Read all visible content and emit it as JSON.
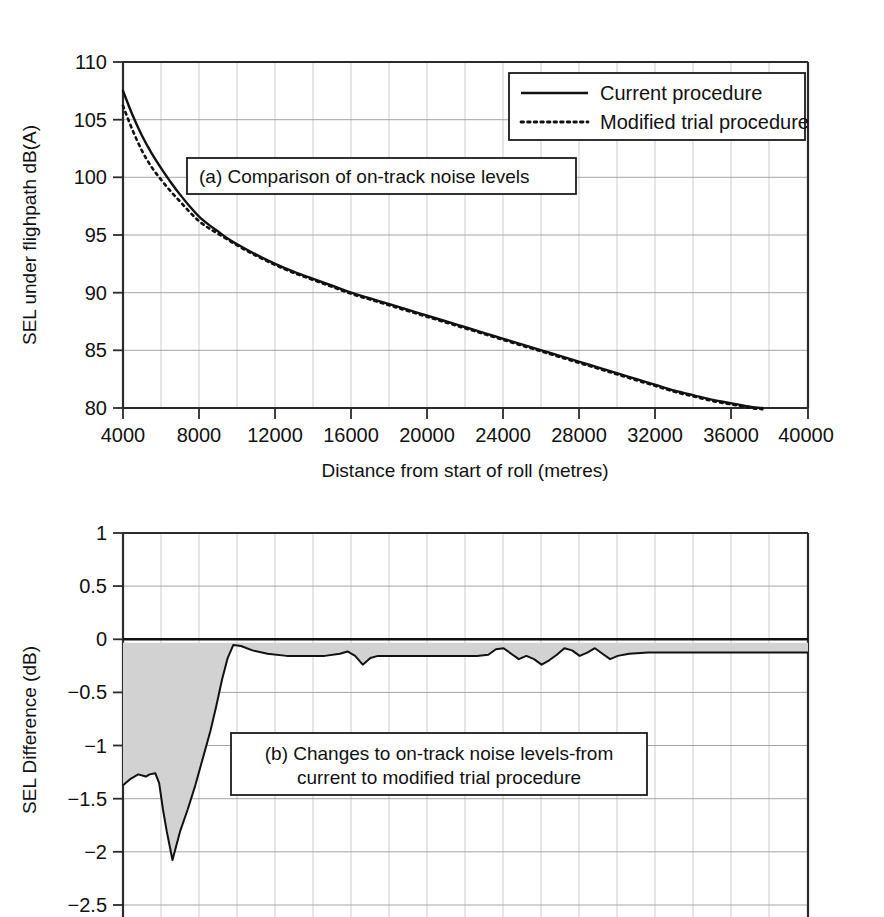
{
  "chart_data": [
    {
      "id": "panel-a",
      "type": "line",
      "title": "(a) Comparison of on-track noise levels",
      "xlabel": "Distance from start of roll (metres)",
      "ylabel": "SEL under flighpath dB(A)",
      "xlim": [
        4000,
        40000
      ],
      "ylim": [
        80,
        110
      ],
      "xticks": [
        4000,
        8000,
        12000,
        16000,
        20000,
        24000,
        28000,
        32000,
        36000,
        40000
      ],
      "yticks": [
        80,
        85,
        90,
        95,
        100,
        105,
        110
      ],
      "xtick_labels": [
        "4000",
        "8000",
        "12000",
        "16000",
        "20000",
        "24000",
        "28000",
        "32000",
        "36000",
        "40000"
      ],
      "ytick_labels": [
        "80",
        "85",
        "90",
        "95",
        "100",
        "105",
        "110"
      ],
      "grid": true,
      "minor_grid_x_step": 2000,
      "legend_position": "top-right",
      "series": [
        {
          "name": "Current procedure",
          "style": "solid",
          "x": [
            4000,
            4500,
            5000,
            5500,
            6000,
            6500,
            7000,
            7500,
            8000,
            8500,
            9000,
            9500,
            10000,
            11000,
            12000,
            13000,
            14000,
            15000,
            16000,
            17000,
            18000,
            19000,
            20000,
            21000,
            22000,
            23000,
            24000,
            25000,
            26000,
            27000,
            28000,
            29000,
            30000,
            31000,
            32000,
            33000,
            34000,
            35000,
            36000,
            37000,
            37600
          ],
          "values": [
            107.5,
            105.4,
            103.6,
            102.1,
            100.8,
            99.6,
            98.5,
            97.5,
            96.6,
            95.9,
            95.3,
            94.7,
            94.2,
            93.3,
            92.5,
            91.8,
            91.2,
            90.6,
            90.0,
            89.5,
            89.0,
            88.5,
            88.0,
            87.5,
            87.0,
            86.5,
            86.0,
            85.5,
            85.0,
            84.5,
            84.0,
            83.5,
            83.0,
            82.5,
            82.0,
            81.5,
            81.1,
            80.7,
            80.4,
            80.1,
            80.0
          ]
        },
        {
          "name": "Modified trial procedure",
          "style": "dotted",
          "x": [
            4000,
            4500,
            5000,
            5500,
            6000,
            6500,
            7000,
            7500,
            8000,
            8500,
            9000,
            9500,
            10000,
            11000,
            12000,
            13000,
            14000,
            15000,
            16000,
            17000,
            18000,
            19000,
            20000,
            21000,
            22000,
            23000,
            24000,
            25000,
            26000,
            27000,
            28000,
            29000,
            30000,
            31000,
            32000,
            33000,
            34000,
            35000,
            36000,
            37000,
            37600
          ],
          "values": [
            106.2,
            104.1,
            102.3,
            100.9,
            99.8,
            98.8,
            97.9,
            97.0,
            96.2,
            95.6,
            95.1,
            94.6,
            94.1,
            93.2,
            92.4,
            91.7,
            91.1,
            90.5,
            89.9,
            89.4,
            88.9,
            88.4,
            87.9,
            87.4,
            86.9,
            86.4,
            85.9,
            85.4,
            84.9,
            84.4,
            83.9,
            83.4,
            82.9,
            82.4,
            81.9,
            81.4,
            81.0,
            80.6,
            80.3,
            80.0,
            79.9
          ]
        }
      ]
    },
    {
      "id": "panel-b",
      "type": "area",
      "title": "(b) Changes to on-track noise levels-from",
      "title_line2": "current to modified trial procedure",
      "xlabel": "",
      "ylabel": "SEL Difference (dB)",
      "xlim": [
        4000,
        40000
      ],
      "ylim": [
        -2.5,
        1
      ],
      "yticks": [
        1,
        0.5,
        0,
        -0.5,
        -1,
        -1.5,
        -2,
        -2.5
      ],
      "ytick_labels": [
        "1",
        "0.5",
        "0",
        "−0.5",
        "−1",
        "−1.5",
        "−2",
        "−2.5"
      ],
      "grid": true,
      "minor_grid_x_step": 2000,
      "fill_color": "#d2d2d2",
      "series": [
        {
          "name": "SEL difference",
          "style": "solid-filled",
          "x": [
            4000,
            4400,
            4800,
            5200,
            5400,
            5700,
            5900,
            6100,
            6300,
            6600,
            7000,
            7400,
            7800,
            8200,
            8600,
            8900,
            9200,
            9500,
            9800,
            10200,
            10800,
            11600,
            12600,
            13600,
            14600,
            15400,
            15800,
            16200,
            16600,
            17000,
            17400,
            17800,
            18600,
            19600,
            20600,
            21600,
            22600,
            23200,
            23600,
            24000,
            24400,
            24800,
            25200,
            25600,
            26000,
            26400,
            26800,
            27200,
            27600,
            28000,
            28400,
            28800,
            29200,
            29600,
            30000,
            30600,
            31600,
            32600,
            33600,
            34600,
            35600,
            36600,
            37600,
            38600,
            39400,
            40000
          ],
          "values": [
            -1.3,
            -1.24,
            -1.2,
            -1.22,
            -1.2,
            -1.19,
            -1.28,
            -1.52,
            -1.72,
            -1.98,
            -1.72,
            -1.52,
            -1.3,
            -1.05,
            -0.8,
            -0.58,
            -0.34,
            -0.14,
            -0.02,
            -0.03,
            -0.07,
            -0.1,
            -0.12,
            -0.12,
            -0.12,
            -0.1,
            -0.08,
            -0.12,
            -0.2,
            -0.14,
            -0.12,
            -0.12,
            -0.12,
            -0.12,
            -0.12,
            -0.12,
            -0.12,
            -0.11,
            -0.06,
            -0.05,
            -0.1,
            -0.15,
            -0.12,
            -0.15,
            -0.2,
            -0.16,
            -0.11,
            -0.05,
            -0.07,
            -0.12,
            -0.09,
            -0.05,
            -0.1,
            -0.15,
            -0.12,
            -0.1,
            -0.09,
            -0.09,
            -0.09,
            -0.09,
            -0.09,
            -0.09,
            -0.09,
            -0.09,
            -0.09,
            -0.09
          ]
        }
      ]
    }
  ],
  "panel_a": {
    "caption": "(a) Comparison of on-track noise levels",
    "ylabel": "SEL under flighpath dB(A)",
    "xlabel": "Distance from start of roll (metres)",
    "legend": {
      "items": [
        {
          "label": "Current procedure",
          "style": "solid"
        },
        {
          "label": "Modified trial procedure",
          "style": "dotted"
        }
      ]
    },
    "ytick_labels": [
      "110",
      "105",
      "100",
      "95",
      "90",
      "85",
      "80"
    ],
    "xtick_labels": [
      "4000",
      "8000",
      "12000",
      "16000",
      "20000",
      "24000",
      "28000",
      "32000",
      "36000",
      "40000"
    ]
  },
  "panel_b": {
    "caption_line1": "(b) Changes to on-track noise levels-from",
    "caption_line2": "current to modified trial procedure",
    "ylabel": "SEL Difference (dB)",
    "ytick_labels": [
      "1",
      "0.5",
      "0",
      "−0.5",
      "−1",
      "−1.5",
      "−2",
      "−2.5"
    ]
  },
  "colors": {
    "line": "#111111",
    "fill": "#d2d2d2",
    "grid_major": "#9a9a9a",
    "grid_minor": "#b8b8b8",
    "axis": "#2b2b2b",
    "background": "#ffffff"
  }
}
